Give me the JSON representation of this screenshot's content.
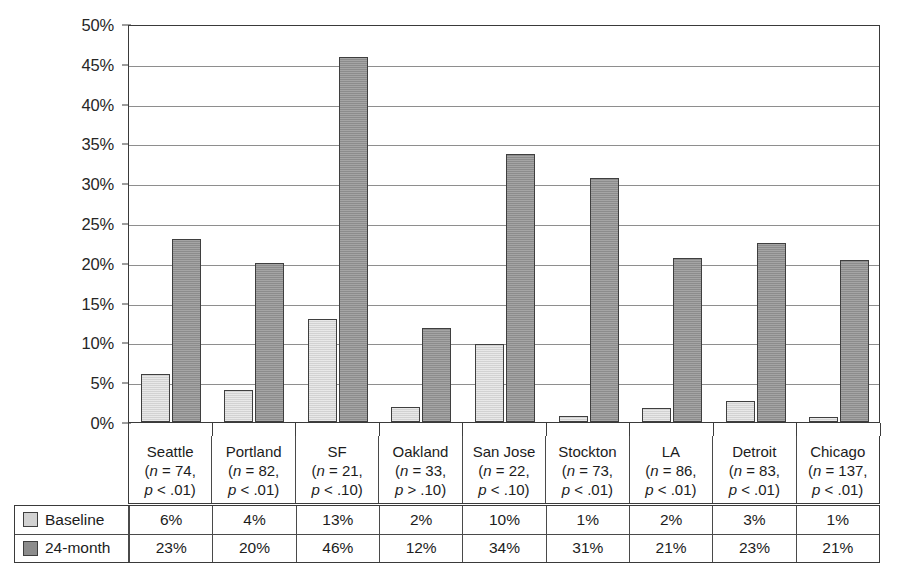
{
  "chart_data": {
    "type": "bar",
    "title": "",
    "xlabel": "",
    "ylabel": "",
    "ylim": [
      0,
      50
    ],
    "ytick_labels": [
      "50%",
      "45%",
      "40%",
      "35%",
      "30%",
      "25%",
      "20%",
      "15%",
      "10%",
      "5%",
      "0%"
    ],
    "ytick_values": [
      50,
      45,
      40,
      35,
      30,
      25,
      20,
      15,
      10,
      5,
      0
    ],
    "grid": true,
    "legend_position": "bottom-table",
    "categories": [
      "Seattle",
      "Portland",
      "SF",
      "Oakland",
      "San Jose",
      "Stockton",
      "LA",
      "Detroit",
      "Chicago"
    ],
    "category_notes": [
      {
        "n": "(n = 74,",
        "p": "p < .01)"
      },
      {
        "n": "(n = 82,",
        "p": "p < .01)"
      },
      {
        "n": "(n = 21,",
        "p": "p < .10)"
      },
      {
        "n": "(n = 33,",
        "p": "p > .10)"
      },
      {
        "n": "(n = 22,",
        "p": "p < .10)"
      },
      {
        "n": "(n = 73,",
        "p": "p < .01)"
      },
      {
        "n": "(n = 86,",
        "p": "p < .01)"
      },
      {
        "n": "(n = 83,",
        "p": "p < .01)"
      },
      {
        "n": "(n = 137,",
        "p": "p < .01)"
      }
    ],
    "series": [
      {
        "name": "Baseline",
        "color": "#d2d2d2",
        "values": [
          6,
          4,
          13,
          2,
          10,
          1,
          2,
          3,
          1
        ],
        "plotted_values": [
          6.0,
          4.0,
          12.9,
          1.9,
          9.8,
          0.8,
          1.7,
          2.6,
          0.6
        ],
        "labels": [
          "6%",
          "4%",
          "13%",
          "2%",
          "10%",
          "1%",
          "2%",
          "3%",
          "1%"
        ]
      },
      {
        "name": "24-month",
        "color": "#8c8c8c",
        "values": [
          23,
          20,
          46,
          12,
          34,
          31,
          21,
          23,
          21
        ],
        "plotted_values": [
          23.0,
          20.0,
          45.9,
          11.8,
          33.7,
          30.6,
          20.6,
          22.5,
          20.4
        ],
        "labels": [
          "23%",
          "20%",
          "46%",
          "12%",
          "34%",
          "31%",
          "21%",
          "23%",
          "21%"
        ]
      }
    ]
  }
}
